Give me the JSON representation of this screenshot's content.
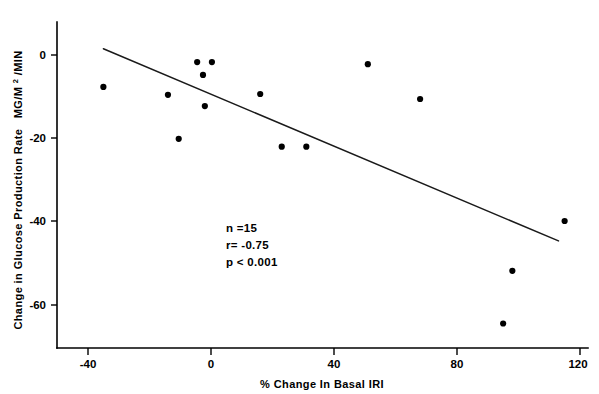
{
  "chart_data": {
    "type": "scatter",
    "title": "",
    "xlabel": "% Change In Basal IRI",
    "ylabel_line1": "Change in Glucose Production Rate",
    "ylabel_units": "MG/M",
    "ylabel_superscript": "2",
    "ylabel_units_tail": "/MIN",
    "ylabel_full": "Change in Glucose Production Rate MG/M2/MIN",
    "xlim": [
      -52,
      122
    ],
    "ylim": [
      -70,
      8
    ],
    "xticks": [
      -40,
      0,
      40,
      80,
      120
    ],
    "xtick_labels": [
      "-40",
      "0",
      "40",
      "80",
      "120"
    ],
    "yticks": [
      0,
      -20,
      -40,
      -60
    ],
    "ytick_labels": [
      "0",
      "-20",
      "-40",
      "-60"
    ],
    "grid": false,
    "legend": "none",
    "marker_color": "#000000",
    "line_color": "#1a1a1a",
    "points": [
      {
        "x": -35,
        "y": -7.7
      },
      {
        "x": -14,
        "y": -9.6
      },
      {
        "x": -10.5,
        "y": -20.2
      },
      {
        "x": -4.5,
        "y": -1.7
      },
      {
        "x": 0.3,
        "y": -1.7
      },
      {
        "x": -2.6,
        "y": -4.8
      },
      {
        "x": -2.0,
        "y": -12.3
      },
      {
        "x": 23,
        "y": -22.1
      },
      {
        "x": 31,
        "y": -22.1
      },
      {
        "x": 16,
        "y": -9.4
      },
      {
        "x": 51,
        "y": -2.2
      },
      {
        "x": 68,
        "y": -10.6
      },
      {
        "x": 115,
        "y": -40.0
      },
      {
        "x": 98,
        "y": -52.0
      },
      {
        "x": 95,
        "y": -64.7
      }
    ],
    "regression": {
      "x_start": -35,
      "y_start": 1.5,
      "x_end": 113,
      "y_end": -44.8
    },
    "annotations": {
      "n_label": "n =15",
      "r_label": "r= -0.75",
      "p_label": "p < 0.001"
    }
  }
}
